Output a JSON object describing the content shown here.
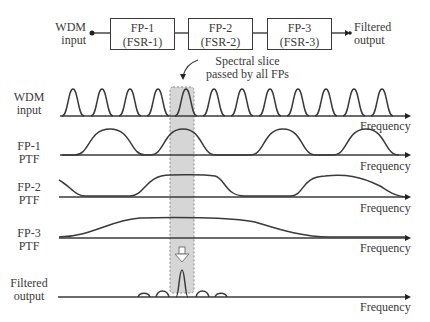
{
  "block_diagram": {
    "input_label_line1": "WDM",
    "input_label_line2": "input",
    "blocks": [
      {
        "line1": "FP-1",
        "line2": "(FSR-1)"
      },
      {
        "line1": "FP-2",
        "line2": "(FSR-2)"
      },
      {
        "line1": "FP-3",
        "line2": "(FSR-3)"
      }
    ],
    "output_label_line1": "Filtered",
    "output_label_line2": "output"
  },
  "annotation": {
    "line1": "Spectral slice",
    "line2": "passed by all FPs"
  },
  "rows": [
    {
      "label_line1": "WDM",
      "label_line2": "input",
      "axis_label": "Frequency"
    },
    {
      "label_line1": "FP-1",
      "label_line2": "PTF",
      "axis_label": "Frequency"
    },
    {
      "label_line1": "FP-2",
      "label_line2": "PTF",
      "axis_label": "Frequency"
    },
    {
      "label_line1": "FP-3",
      "label_line2": "PTF",
      "axis_label": "Frequency"
    },
    {
      "label_line1": "Filtered",
      "label_line2": "output",
      "axis_label": "Frequency"
    }
  ],
  "colors": {
    "line": "#3a3a3a",
    "shade": "#d6d6d6",
    "shade_border": "#8a8a8a"
  }
}
